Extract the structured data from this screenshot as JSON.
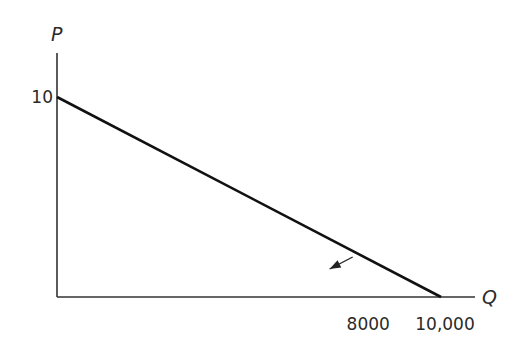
{
  "chart_data": {
    "type": "line",
    "title": "",
    "xlabel": "Q",
    "ylabel": "P",
    "xlim": [
      0,
      10500
    ],
    "ylim": [
      0,
      11
    ],
    "grid": false,
    "legend": null,
    "series": [
      {
        "name": "demand",
        "x": [
          0,
          10000
        ],
        "y": [
          10,
          0
        ]
      }
    ],
    "y_tick_labels": [
      {
        "value": 10,
        "label": "10"
      }
    ],
    "x_tick_labels": [
      {
        "value": 8000,
        "label": "8000"
      },
      {
        "value": 10000,
        "label": "10,000"
      }
    ],
    "annotations": [
      {
        "type": "arrow",
        "from": {
          "x": 7700,
          "y": 2.0
        },
        "to": {
          "x": 7100,
          "y": 1.4
        },
        "description": "arrow pointing inward from demand line"
      }
    ]
  },
  "colors": {
    "line": "#111111",
    "axis": "#333333",
    "text": "#2a2a2a"
  }
}
